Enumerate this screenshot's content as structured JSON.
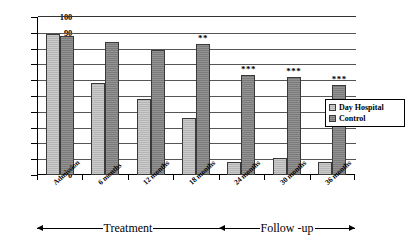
{
  "chart_data": {
    "type": "bar",
    "title": "",
    "xlabel": "",
    "ylabel": "",
    "ylim": [
      0,
      100
    ],
    "ytick_step": 10,
    "yticks": [
      "100",
      "90",
      "80",
      "70",
      "60",
      "50",
      "40",
      "30",
      "20",
      "10",
      "0"
    ],
    "grid": true,
    "legend_position": "right-middle",
    "categories": [
      "Admission",
      "6 months",
      "12 months",
      "18 months",
      "24 months",
      "30 months",
      "36 months"
    ],
    "series": [
      {
        "name": "Day Hospital",
        "color": "#b5b5b5",
        "values": [
          89,
          58,
          48,
          36,
          8,
          11,
          8
        ]
      },
      {
        "name": "Control",
        "color": "#7b7b7b",
        "values": [
          88,
          84,
          79,
          83,
          63,
          62,
          57
        ]
      }
    ],
    "significance_markers": [
      "",
      "",
      "",
      "**",
      "***",
      "***",
      "***"
    ],
    "annotations": [
      {
        "label": "Treatment",
        "spans_categories": [
          "Admission",
          "18 months"
        ]
      },
      {
        "label": "Follow -up",
        "spans_categories": [
          "24 months",
          "36 months"
        ]
      }
    ]
  },
  "legend": {
    "items": [
      {
        "label": "Day Hospital"
      },
      {
        "label": "Control"
      }
    ]
  }
}
